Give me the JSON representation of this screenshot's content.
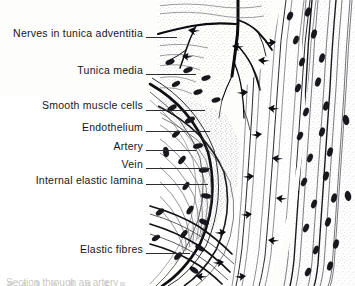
{
  "figure": {
    "background_color": "#fdfdfb",
    "ink_color": "#16161a",
    "width": 355,
    "height": 286
  },
  "labels": [
    {
      "id": "nerves-in-tunica-adventitia",
      "text": "Nerves in tunica adventitia",
      "text_right_x": 143,
      "y": 33,
      "line_x1": 146,
      "line_x2": 177,
      "line_y": 37
    },
    {
      "id": "tunica-media",
      "text": "Tunica media",
      "text_right_x": 143,
      "y": 70,
      "line_x1": 146,
      "line_x2": 196,
      "line_y": 74
    },
    {
      "id": "smooth-muscle-cells",
      "text": "Smooth muscle cells",
      "text_right_x": 143,
      "y": 105,
      "line_x1": 146,
      "line_x2": 205,
      "line_y": 110
    },
    {
      "id": "endothelium",
      "text": "Endothelium",
      "text_right_x": 143,
      "y": 127,
      "line_x1": 146,
      "line_x2": 210,
      "line_y": 131
    },
    {
      "id": "artery",
      "text": "Artery",
      "text_right_x": 143,
      "y": 146,
      "line_x1": 146,
      "line_x2": 196,
      "line_y": 150
    },
    {
      "id": "vein",
      "text": "Vein",
      "text_right_x": 143,
      "y": 164,
      "line_x1": 146,
      "line_x2": 212,
      "line_y": 168
    },
    {
      "id": "internal-elastic-lamina",
      "text": "Internal elastic lamina",
      "text_right_x": 143,
      "y": 180,
      "line_x1": 146,
      "line_x2": 208,
      "line_y": 184
    },
    {
      "id": "elastic-fibres",
      "text": "Elastic fibres",
      "text_right_x": 143,
      "y": 249,
      "line_x1": 146,
      "line_x2": 190,
      "line_y": 253
    }
  ],
  "caption": {
    "text": "Section through an artery"
  },
  "structures": {
    "artery_wall": "curved vessel wall on the left with dark internal elastic lamina",
    "vein_wall": "vertical banded wall on the right",
    "nerve_trunk": "dark branching nerve at top centre",
    "lumen": "pale region at lower left"
  }
}
